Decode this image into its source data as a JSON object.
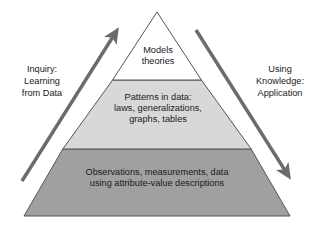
{
  "diagram": {
    "type": "knowledge-pyramid",
    "title": "",
    "colors": {
      "tier_top_fill": "#ffffff",
      "tier_middle_fill": "#d8d8d8",
      "tier_base_fill": "#a0a0a0",
      "outline": "#555555",
      "arrow": "#6b6b6b",
      "text": "#1a1a1a",
      "background": "#ffffff"
    },
    "geometry": {
      "apex_x": 157,
      "apex_y": 12,
      "base_left_x": 24,
      "base_right_x": 290,
      "base_y": 216,
      "divider_upper_y": 80,
      "divider_lower_y": 149
    },
    "tiers": [
      {
        "id": "top",
        "level": 1,
        "fill": "#ffffff",
        "text": "Models\ntheories"
      },
      {
        "id": "middle",
        "level": 2,
        "fill": "#d8d8d8",
        "text": "Patterns in data:\nlaws, generalizations,\ngraphs, tables"
      },
      {
        "id": "base",
        "level": 3,
        "fill": "#a0a0a0",
        "text": "Observations, measurements, data\nusing attribute-value descriptions"
      }
    ],
    "arrows": [
      {
        "id": "left",
        "direction": "up-right",
        "label": "Inquiry:\nLearning\nfrom Data",
        "tail_x": 22,
        "tail_y": 181,
        "tip_x": 118,
        "tip_y": 30
      },
      {
        "id": "right",
        "direction": "down-right",
        "label": "Using\nKnowledge:\nApplication",
        "tail_x": 196,
        "tail_y": 30,
        "tip_x": 290,
        "tip_y": 178
      }
    ]
  }
}
